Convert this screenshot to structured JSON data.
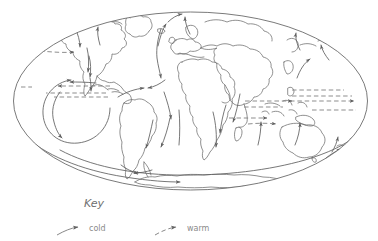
{
  "figure": {
    "type": "map-diagram",
    "projection": "elliptical world projection",
    "stroke_color": "#6b6b6b",
    "coast_color": "#6b6b6b",
    "text_color": "#8a8a8a",
    "background": "#ffffff"
  },
  "key": {
    "title": "Key",
    "items": [
      {
        "label": "cold",
        "style": "solid",
        "arrow": "arrow-head",
        "icon": "cold-current-arrow-icon"
      },
      {
        "label": "warm",
        "style": "dashed",
        "arrow": "arrow-head",
        "icon": "warm-current-arrow-icon"
      }
    ]
  },
  "map": {
    "outline_name": "world-ellipse-outline",
    "landmasses": [
      "north-america",
      "greenland",
      "south-america",
      "africa",
      "europe",
      "asia",
      "australia",
      "antarctica",
      "indonesia",
      "japan"
    ],
    "currents": {
      "cold_solid_count": 18,
      "warm_dashed_count": 10
    }
  }
}
